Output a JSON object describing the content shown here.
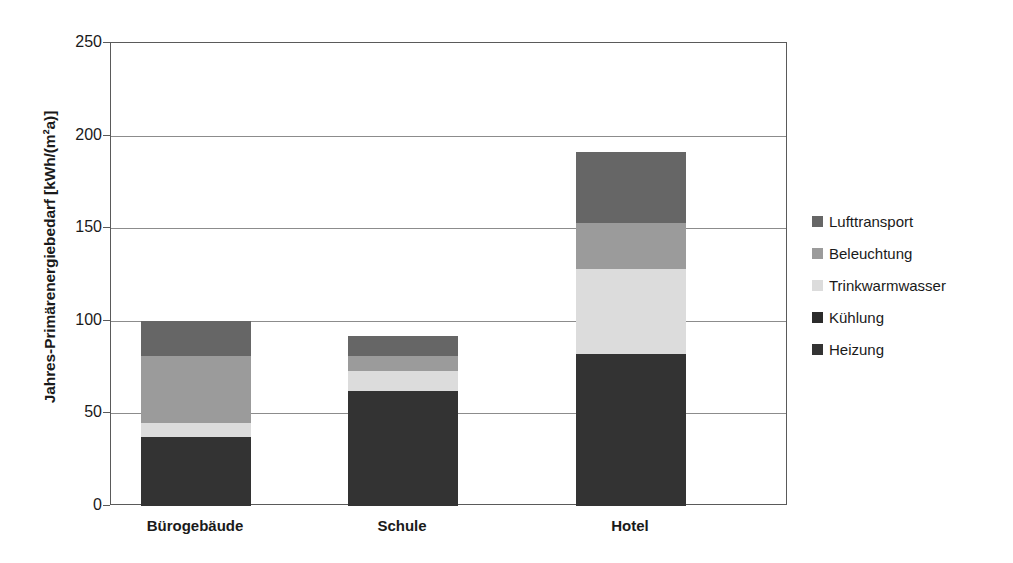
{
  "chart_data": {
    "type": "bar",
    "subtype": "stacked-bar",
    "title": "",
    "xlabel": "",
    "ylabel": "Jahres-Primärenergiebedarf [kWh/(m²a)]",
    "ylim": [
      0,
      250
    ],
    "yticks": [
      0,
      50,
      100,
      150,
      200,
      250
    ],
    "ytick_labels": [
      "0",
      "50",
      "100",
      "150",
      "200",
      "250"
    ],
    "grid": true,
    "legend_position": "right",
    "categories": [
      "Bürogebäude",
      "Schule",
      "Hotel"
    ],
    "series": [
      {
        "name": "Heizung",
        "color": "#333333",
        "values": [
          37,
          62,
          82
        ]
      },
      {
        "name": "Kühlung",
        "color": "#2b2b2b",
        "values": [
          0,
          0,
          0
        ]
      },
      {
        "name": "Trinkwarmwasser",
        "color": "#dcdcdc",
        "values": [
          8,
          11,
          46
        ]
      },
      {
        "name": "Beleuchtung",
        "color": "#9b9b9b",
        "values": [
          36,
          8,
          25
        ]
      },
      {
        "name": "Lufttransport",
        "color": "#666666",
        "values": [
          19,
          11,
          38
        ]
      }
    ],
    "totals": [
      100,
      92,
      191
    ]
  },
  "legend": {
    "items": [
      {
        "label": "Lufttransport",
        "color": "#666666"
      },
      {
        "label": "Beleuchtung",
        "color": "#9b9b9b"
      },
      {
        "label": "Trinkwarmwasser",
        "color": "#dcdcdc"
      },
      {
        "label": "Kühlung",
        "color": "#2b2b2b"
      },
      {
        "label": "Heizung",
        "color": "#333333"
      }
    ]
  },
  "axis": {
    "y_title": "Jahres-Primärenergiebedarf [kWh/(m²a)]",
    "y_ticks": [
      "250",
      "200",
      "150",
      "100",
      "50",
      "0"
    ],
    "x_ticks": [
      "Bürogebäude",
      "Schule",
      "Hotel"
    ]
  },
  "colors": {
    "frame": "#5a5a5a",
    "gridline": "#8c8c8c",
    "background": "#ffffff",
    "text": "#1a1a1a"
  }
}
